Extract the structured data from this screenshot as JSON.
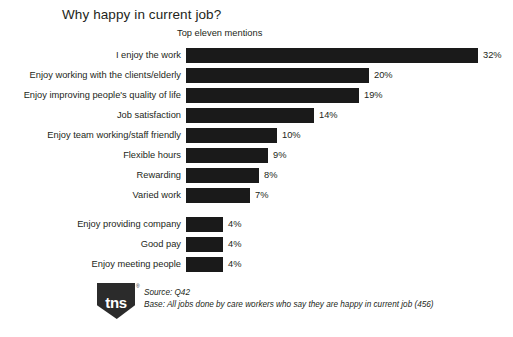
{
  "header": {
    "title": "Why happy in current job?",
    "subtitle": "Top eleven mentions"
  },
  "footer": {
    "logo_text": "tns",
    "logo_registered": "®",
    "source": "Source:  Q42",
    "base": "Base: All jobs done by care workers who say they are happy in current job (456)"
  },
  "chart_data": {
    "type": "bar",
    "orientation": "horizontal",
    "title": "Why happy in current job?",
    "subtitle": "Top eleven mentions",
    "xlabel": "",
    "ylabel": "",
    "xlim": [
      0,
      32
    ],
    "grid": false,
    "legend": false,
    "value_suffix": "%",
    "bar_color": "#1a1a1a",
    "categories": [
      "I enjoy the work",
      "Enjoy working with the clients/elderly",
      "Enjoy improving people's quality of life",
      "Job satisfaction",
      "Enjoy team working/staff friendly",
      "Flexible hours",
      "Rewarding",
      "Varied work",
      "Enjoy providing company",
      "Good pay",
      "Enjoy meeting people"
    ],
    "values": [
      32,
      20,
      19,
      14,
      10,
      9,
      8,
      7,
      4,
      4,
      4
    ],
    "value_labels": [
      "32%",
      "20%",
      "19%",
      "14%",
      "10%",
      "9%",
      "8%",
      "7%",
      "4%",
      "4%",
      "4%"
    ]
  }
}
